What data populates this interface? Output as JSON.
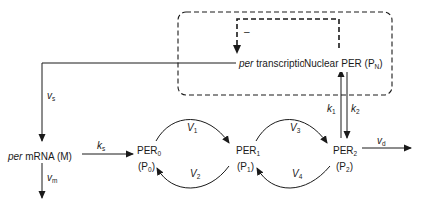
{
  "diagram": {
    "nodes": {
      "transcription": {
        "italic_prefix": "per",
        "label": " transcription"
      },
      "nuclear": {
        "label": "Nuclear PER (P",
        "sub": "N",
        "suffix": ")"
      },
      "mrna": {
        "italic_prefix": "per",
        "label": " mRNA (M)"
      },
      "per0": {
        "name": "PER",
        "sub": "0",
        "alias": "(P",
        "alias_sub": "0",
        "alias_suffix": ")"
      },
      "per1": {
        "name": "PER",
        "sub": "1",
        "alias": "(P",
        "alias_sub": "1",
        "alias_suffix": ")"
      },
      "per2": {
        "name": "PER",
        "sub": "2",
        "alias": "(P",
        "alias_sub": "2",
        "alias_suffix": ")"
      }
    },
    "rates": {
      "vs": {
        "sym": "v",
        "sub": "s"
      },
      "vm": {
        "sym": "v",
        "sub": "m"
      },
      "ks": {
        "sym": "k",
        "sub": "s"
      },
      "V1": {
        "sym": "V",
        "sub": "1"
      },
      "V2": {
        "sym": "V",
        "sub": "2"
      },
      "V3": {
        "sym": "V",
        "sub": "3"
      },
      "V4": {
        "sym": "V",
        "sub": "4"
      },
      "k1": {
        "sym": "k",
        "sub": "1"
      },
      "k2": {
        "sym": "k",
        "sub": "2"
      },
      "vd": {
        "sym": "v",
        "sub": "d"
      }
    },
    "feedback_sign": "–",
    "colors": {
      "stroke": "#1a1a1a",
      "background": "#ffffff"
    }
  }
}
